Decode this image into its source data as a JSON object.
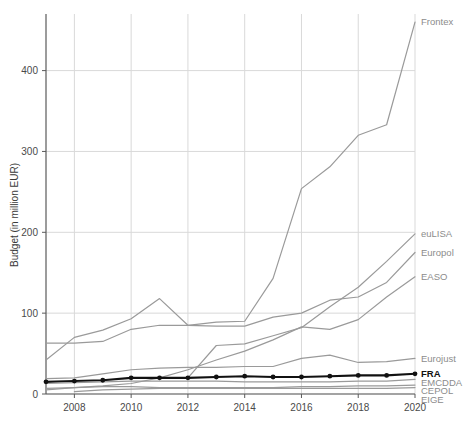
{
  "chart_data": {
    "type": "line",
    "title": "",
    "xlabel": "",
    "ylabel": "Budget (in million EUR)",
    "xlim": [
      2007,
      2020
    ],
    "ylim": [
      0,
      470
    ],
    "x": [
      2007,
      2008,
      2009,
      2010,
      2011,
      2012,
      2013,
      2014,
      2015,
      2016,
      2017,
      2018,
      2019,
      2020
    ],
    "xticks": [
      2008,
      2010,
      2012,
      2014,
      2016,
      2018,
      2020
    ],
    "xtick_labels": [
      "2008",
      "2010",
      "2012",
      "2014",
      "2016",
      "2018",
      "2020"
    ],
    "yticks": [
      0,
      100,
      200,
      300,
      400
    ],
    "ytick_labels": [
      "0",
      "100",
      "200",
      "300",
      "400"
    ],
    "grid": true,
    "legend_position": "right-inline-labels",
    "series": [
      {
        "name": "Frontex",
        "label": "Frontex",
        "color": "#9a9a9a",
        "highlight": false,
        "values": [
          42,
          70,
          79,
          93,
          118,
          85,
          89,
          90,
          143,
          254,
          281,
          320,
          333,
          460
        ]
      },
      {
        "name": "euLISA",
        "label": "euLISA",
        "color": "#9a9a9a",
        "highlight": false,
        "values": [
          0,
          0,
          0,
          0,
          0,
          20,
          60,
          62,
          72,
          82,
          108,
          132,
          164,
          198
        ]
      },
      {
        "name": "Europol",
        "label": "Europol",
        "color": "#9a9a9a",
        "highlight": false,
        "values": [
          63,
          63,
          65,
          80,
          85,
          85,
          84,
          84,
          95,
          100,
          116,
          120,
          138,
          175
        ]
      },
      {
        "name": "EASO",
        "label": "EASO",
        "color": "#9a9a9a",
        "highlight": false,
        "values": [
          5,
          8,
          10,
          13,
          20,
          30,
          42,
          53,
          67,
          83,
          80,
          92,
          120,
          145
        ]
      },
      {
        "name": "Eurojust",
        "label": "Eurojust",
        "color": "#9a9a9a",
        "highlight": false,
        "values": [
          19,
          20,
          25,
          30,
          32,
          33,
          33,
          34,
          34,
          44,
          48,
          39,
          40,
          44
        ]
      },
      {
        "name": "FRA",
        "label": "FRA",
        "color": "#111111",
        "highlight": true,
        "values": [
          15,
          16,
          17,
          20,
          20,
          20,
          21,
          22,
          21,
          21,
          22,
          23,
          23,
          25
        ]
      },
      {
        "name": "EMCDDA",
        "label": "EMCDDA",
        "color": "#9a9a9a",
        "highlight": false,
        "values": [
          13,
          14,
          15,
          16,
          16,
          16,
          16,
          15,
          15,
          15,
          15,
          16,
          16,
          18
        ]
      },
      {
        "name": "CEPOL",
        "label": "CEPOL",
        "color": "#9a9a9a",
        "highlight": false,
        "values": [
          7,
          8,
          9,
          9,
          8,
          8,
          8,
          8,
          8,
          9,
          9,
          10,
          10,
          11
        ]
      },
      {
        "name": "EIGE",
        "label": "EIGE",
        "color": "#9a9a9a",
        "highlight": false,
        "values": [
          0,
          3,
          5,
          6,
          7,
          7,
          7,
          7,
          7,
          7,
          7,
          7,
          7,
          8
        ]
      }
    ]
  }
}
